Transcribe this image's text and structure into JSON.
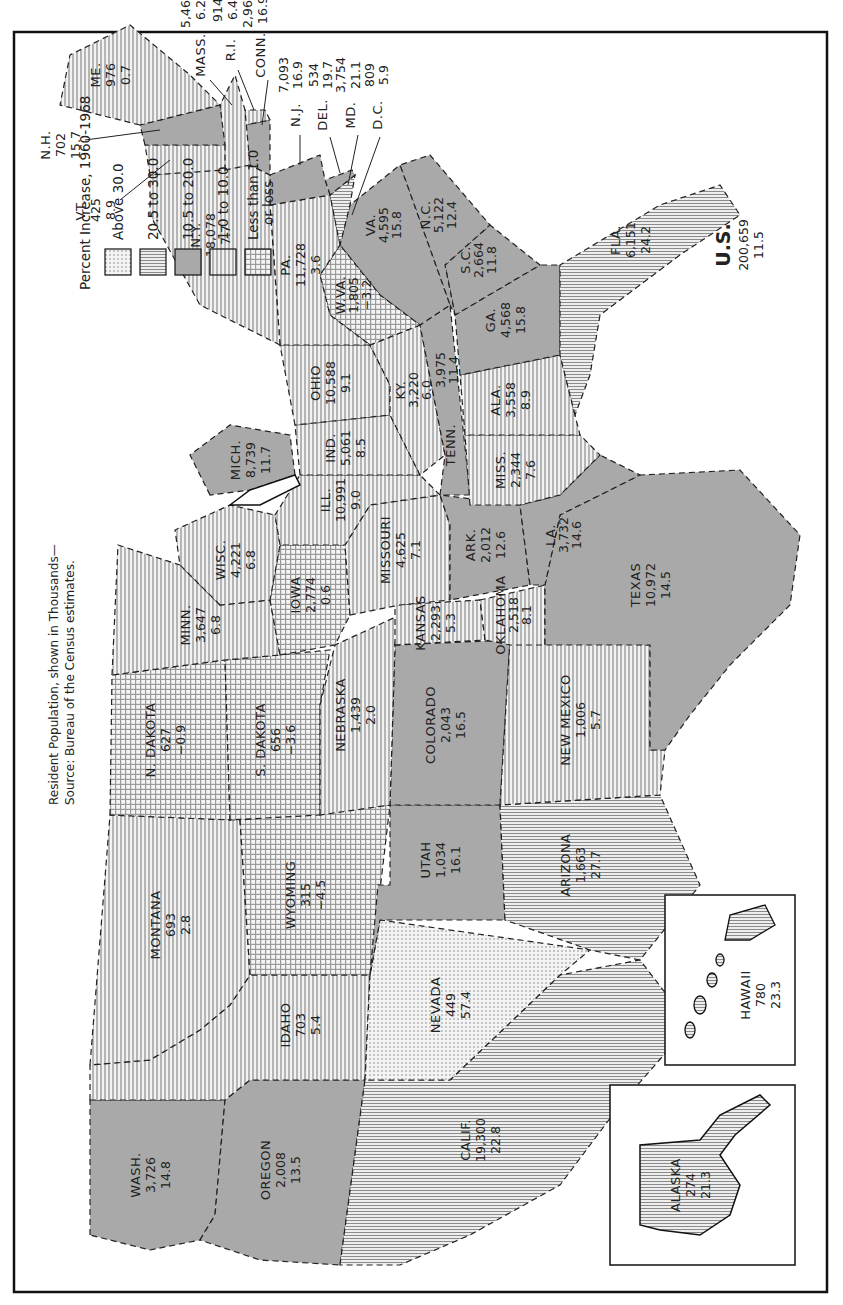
{
  "title": {
    "line1": "Resident Population, shown in Thousands—",
    "line2": "Source: Bureau of the Census estimates."
  },
  "legend": {
    "title": "Percent Increase, 1960-1968",
    "items": [
      {
        "label": "Above  30.0",
        "pattern": "dots"
      },
      {
        "label": "20.5 to 30.0",
        "pattern": "vlines"
      },
      {
        "label": "10.5 to 20.0",
        "pattern": "solid"
      },
      {
        "label": "1.0 to 10.0",
        "pattern": "hlines"
      },
      {
        "label_line1": "Less than 1.0",
        "label_line2": "or loss",
        "pattern": "cross"
      }
    ]
  },
  "us_total": {
    "name": "U.S.",
    "population": "200,659",
    "pct": "11.5"
  },
  "states": {
    "wa": {
      "name": "WASH.",
      "pop": "3,726",
      "pct": "14.8"
    },
    "or": {
      "name": "OREGON",
      "pop": "2,008",
      "pct": "13.5"
    },
    "ca": {
      "name": "CALIF.",
      "pop": "19,300",
      "pct": "22.8"
    },
    "id": {
      "name": "IDAHO",
      "pop": "703",
      "pct": "5.4"
    },
    "nv": {
      "name": "NEVADA",
      "pop": "449",
      "pct": "57.4"
    },
    "mt": {
      "name": "MONTANA",
      "pop": "693",
      "pct": "2.8"
    },
    "wy": {
      "name": "WYOMING",
      "pop": "315",
      "pct": "−4.5"
    },
    "ut": {
      "name": "UTAH",
      "pop": "1,034",
      "pct": "16.1"
    },
    "az": {
      "name": "ARIZONA",
      "pop": "1,663",
      "pct": "27.7"
    },
    "co": {
      "name": "COLORADO",
      "pop": "2,043",
      "pct": "16.5"
    },
    "nm": {
      "name": "NEW MEXICO",
      "pop": "1,006",
      "pct": "5.7"
    },
    "nd": {
      "name": "N. DAKOTA",
      "pop": "627",
      "pct": "−0.9"
    },
    "sd": {
      "name": "S. DAKOTA",
      "pop": "656",
      "pct": "−3.6"
    },
    "ne": {
      "name": "NEBRASKA",
      "pop": "1,439",
      "pct": "2.0"
    },
    "ks": {
      "name": "KANSAS",
      "pop": "2,293",
      "pct": "5.3"
    },
    "ok": {
      "name": "OKLAHOMA",
      "pop": "2,518",
      "pct": "8.1"
    },
    "tx": {
      "name": "TEXAS",
      "pop": "10,972",
      "pct": "14.5"
    },
    "mn": {
      "name": "MINN.",
      "pop": "3,647",
      "pct": "6.8"
    },
    "ia": {
      "name": "IOWA",
      "pop": "2,774",
      "pct": "0.6"
    },
    "mo": {
      "name": "MISSOURI",
      "pop": "4,625",
      "pct": "7.1"
    },
    "ar": {
      "name": "ARK.",
      "pop": "2,012",
      "pct": "12.6"
    },
    "la": {
      "name": "LA.",
      "pop": "3,732",
      "pct": "14.6"
    },
    "wi": {
      "name": "WISC.",
      "pop": "4,221",
      "pct": "6.8"
    },
    "il": {
      "name": "ILL.",
      "pop": "10,991",
      "pct": "9.0"
    },
    "mi": {
      "name": "MICH.",
      "pop": "8,739",
      "pct": "11.7"
    },
    "in": {
      "name": "IND.",
      "pop": "5,061",
      "pct": "8.5"
    },
    "oh": {
      "name": "OHIO",
      "pop": "10,588",
      "pct": "9.1"
    },
    "ky": {
      "name": "KY.",
      "pop": "3,220",
      "pct": "6.0"
    },
    "tn": {
      "name": "TENN.",
      "pop": "3,975",
      "pct": "11.4"
    },
    "ms": {
      "name": "MISS.",
      "pop": "2,344",
      "pct": "7.6"
    },
    "al": {
      "name": "ALA.",
      "pop": "3,558",
      "pct": "8.9"
    },
    "ga": {
      "name": "GA.",
      "pop": "4,568",
      "pct": "15.8"
    },
    "fl": {
      "name": "FLA.",
      "pop": "6,151",
      "pct": "24.2"
    },
    "sc": {
      "name": "S.C.",
      "pop": "2,664",
      "pct": "11.8"
    },
    "nc": {
      "name": "N.C.",
      "pop": "5,122",
      "pct": "12.4"
    },
    "va": {
      "name": "VA.",
      "pop": "4,595",
      "pct": "15.8"
    },
    "wv": {
      "name": "W.VA.",
      "pop": "1,805",
      "pct": "−3.2"
    },
    "pa": {
      "name": "PA.",
      "pop": "11,728",
      "pct": "3.6"
    },
    "ny": {
      "name": "N.Y.",
      "pop": "18,078",
      "pct": "7.7"
    },
    "vt": {
      "name": "VT.",
      "pop": "425",
      "pct": "8.9"
    },
    "nh": {
      "name": "N.H.",
      "pop": "702",
      "pct": "15.7"
    },
    "me": {
      "name": "ME.",
      "pop": "976",
      "pct": "0.7"
    },
    "ma": {
      "name": "MASS.",
      "pop": "5,469",
      "pct": "6.2"
    },
    "ri": {
      "name": "R.I.",
      "pop": "914",
      "pct": "6.4"
    },
    "ct": {
      "name": "CONN.",
      "pop": "2,963",
      "pct": "16.9"
    },
    "nj": {
      "name": "N.J.",
      "pop": "7,093",
      "pct": "16.9"
    },
    "de": {
      "name": "DEL.",
      "pop": "534",
      "pct": "19.7"
    },
    "md": {
      "name": "MD.",
      "pop": "3,754",
      "pct": "21.1"
    },
    "dc": {
      "name": "D.C.",
      "pop": "809",
      "pct": "5.9"
    },
    "ak": {
      "name": "ALASKA",
      "pop": "274",
      "pct": "21.3"
    },
    "hi": {
      "name": "HAWAII",
      "pop": "780",
      "pct": "23.3"
    }
  }
}
